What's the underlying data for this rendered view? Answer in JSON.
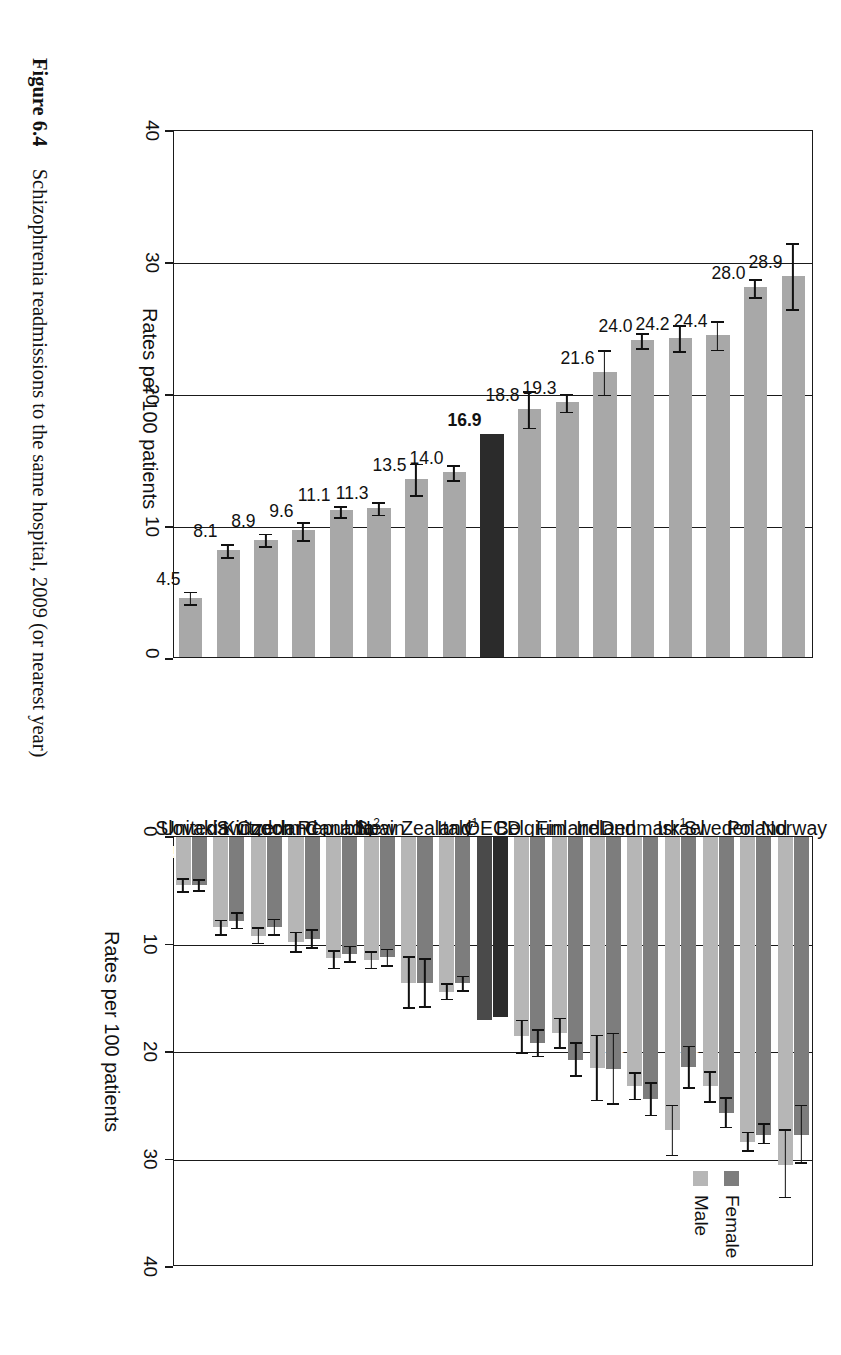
{
  "figure": {
    "number": "Figure 6.4",
    "title": "Schizophrenia readmissions to the same hospital, 2009 (or nearest year)"
  },
  "legend": {
    "position": "top-right",
    "female_label": "Female",
    "male_label": "Male"
  },
  "axis": {
    "left_panel_title": "Rates per 100 patients",
    "right_panel_title": "Rates per 100 patients",
    "ticks": [
      "0",
      "10",
      "20",
      "30",
      "40"
    ],
    "left_ticks_reversed": [
      "40",
      "30",
      "20",
      "10",
      "0"
    ]
  },
  "colors": {
    "female": "#7d7d7d",
    "male": "#b6b6b6",
    "total": "#a8a8a8",
    "oecd_highlight": "#2b2b2b",
    "axis": "#1a1a1a"
  },
  "chart_data": [
    {
      "type": "bar",
      "name": "total",
      "title": "Schizophrenia readmissions to the same hospital, 2009 (or nearest year)",
      "xlabel": "",
      "ylabel": "Rates per 100 patients",
      "ylim": [
        0,
        40
      ],
      "grid": true,
      "orientation": "horizontal",
      "categories": [
        "Norway",
        "Poland",
        "Sweden",
        "Israel",
        "Denmark¹",
        "Ireland",
        "Finland",
        "Belgium",
        "OECD",
        "Italy",
        "New Zealand¹",
        "Spain",
        "Canada²",
        "Czech Republic",
        "Switzerland",
        "United Kingdom",
        "Slovakia"
      ],
      "values": [
        28.9,
        28.0,
        24.4,
        24.2,
        24.0,
        21.6,
        19.3,
        18.8,
        16.9,
        14.0,
        13.5,
        11.3,
        11.1,
        9.6,
        8.9,
        8.1,
        4.5
      ],
      "labels": [
        "28.9",
        "28.0",
        "24.4",
        "24.2",
        "24.0",
        "21.6",
        "19.3",
        "18.8",
        "16.9",
        "14.0",
        "13.5",
        "11.3",
        "11.1",
        "9.6",
        "8.9",
        "8.1",
        "4.5"
      ],
      "errors_low": [
        26.4,
        27.3,
        23.3,
        23.2,
        23.4,
        19.9,
        18.6,
        17.4,
        16.9,
        13.4,
        12.3,
        10.8,
        10.6,
        8.9,
        8.4,
        7.6,
        4.0
      ],
      "errors_high": [
        31.5,
        28.8,
        25.6,
        25.3,
        24.7,
        23.4,
        20.1,
        20.3,
        16.9,
        14.7,
        14.8,
        11.9,
        11.6,
        10.4,
        9.5,
        8.7,
        5.1
      ],
      "highlight_category": "OECD"
    },
    {
      "type": "bar",
      "name": "by-sex",
      "title": "Schizophrenia readmissions to the same hospital, 2009 (or nearest year)",
      "xlabel": "",
      "ylabel": "Rates per 100 patients",
      "ylim": [
        0,
        40
      ],
      "grid": true,
      "orientation": "vertical",
      "categories": [
        "Norway",
        "Poland",
        "Sweden",
        "Israel",
        "Denmark¹",
        "Ireland",
        "Finland",
        "Belgium",
        "OECD",
        "Italy",
        "New Zealand¹",
        "Spain",
        "Canada²",
        "Czech Republic",
        "Switzerland",
        "United Kingdom",
        "Slovakia"
      ],
      "series": [
        {
          "name": "Female",
          "values": [
            27.7,
            27.7,
            25.7,
            21.4,
            24.4,
            21.6,
            20.7,
            19.2,
            16.7,
            13.6,
            13.6,
            11.2,
            10.9,
            9.5,
            8.4,
            7.8,
            4.5
          ],
          "labels": [
            "27.7",
            "27.7",
            "25.7",
            "21.4",
            "24.4",
            "21.6",
            "20.7",
            "19.2",
            "16.7",
            "13.6",
            "13.6",
            "11.2",
            "10.9",
            "9.5",
            "8.4",
            "7.8",
            "4.5"
          ],
          "errors_low": [
            24.9,
            26.6,
            24.2,
            19.4,
            22.8,
            18.2,
            19.1,
            17.9,
            16.7,
            12.9,
            11.3,
            10.4,
            10.1,
            8.6,
            7.6,
            7.0,
            3.9
          ],
          "errors_high": [
            30.4,
            28.6,
            27.1,
            23.4,
            26.0,
            24.9,
            22.3,
            20.5,
            16.7,
            14.4,
            15.9,
            12.1,
            11.7,
            10.4,
            9.2,
            8.6,
            5.1
          ]
        },
        {
          "name": "Male",
          "values": [
            30.5,
            28.4,
            23.2,
            27.3,
            23.2,
            21.5,
            18.2,
            18.5,
            17.0,
            14.4,
            13.6,
            11.4,
            11.3,
            9.8,
            9.2,
            8.4,
            4.5
          ],
          "labels": [
            "30.5",
            "28.4",
            "23.2",
            "27.3",
            "23.2",
            "21.5",
            "18.2",
            "18.5",
            "17",
            "14.4",
            "13.6",
            "11.4",
            "11.3",
            "9.8",
            "9.2",
            "8.4",
            "4.5"
          ],
          "errors_low": [
            27.2,
            27.4,
            21.8,
            24.9,
            21.9,
            18.4,
            16.8,
            17.0,
            17.0,
            13.6,
            11.1,
            10.6,
            10.5,
            8.8,
            8.4,
            7.7,
            3.8
          ],
          "errors_high": [
            33.6,
            29.3,
            24.7,
            29.7,
            24.5,
            24.6,
            19.7,
            20.2,
            17.0,
            15.2,
            16.0,
            12.3,
            12.3,
            10.8,
            10.0,
            9.2,
            5.2
          ]
        }
      ],
      "highlight_category": "OECD"
    }
  ]
}
